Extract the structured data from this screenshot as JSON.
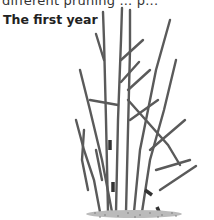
{
  "page": {
    "top_text": "different  pruning  ...  p...",
    "caption": "The first year"
  },
  "illustration": {
    "subject": "shrub-stems-line-drawing",
    "stroke_color": "#555555",
    "ground_color": "#888888"
  }
}
